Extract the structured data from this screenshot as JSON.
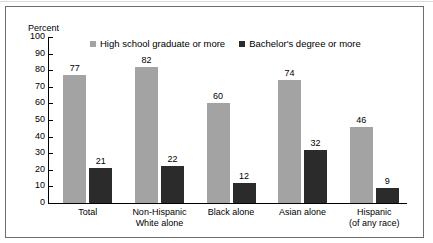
{
  "chart_data": {
    "type": "bar",
    "title": "",
    "xlabel": "",
    "ylabel": "Percent",
    "ylim": [
      0,
      100
    ],
    "yticks": [
      0,
      10,
      20,
      30,
      40,
      50,
      60,
      70,
      80,
      90,
      100
    ],
    "ytick_labels": [
      "0",
      "10",
      "20",
      "30",
      "40",
      "50",
      "60",
      "70",
      "80",
      "90",
      "100"
    ],
    "grid": false,
    "legend_position": "top-center",
    "categories": [
      "Total",
      "Non-Hispanic White alone",
      "Black alone",
      "Asian alone",
      "Hispanic (of any race)"
    ],
    "category_lines": [
      [
        "Total"
      ],
      [
        "Non-Hispanic",
        "White alone"
      ],
      [
        "Black alone"
      ],
      [
        "Asian alone"
      ],
      [
        "Hispanic",
        "(of any race)"
      ]
    ],
    "series": [
      {
        "name": "High school graduate or more",
        "color": "#a3a3a3",
        "values": [
          77,
          82,
          60,
          74,
          46
        ],
        "labels": [
          "77",
          "82",
          "60",
          "74",
          "46"
        ]
      },
      {
        "name": "Bachelor's degree or more",
        "color": "#2b2b2b",
        "values": [
          21,
          22,
          12,
          32,
          9
        ],
        "labels": [
          "21",
          "22",
          "12",
          "32",
          "9"
        ]
      }
    ]
  },
  "axis": {
    "y_title": "Percent"
  },
  "legend": {
    "items": [
      {
        "label": "High school graduate or more",
        "color": "#a3a3a3"
      },
      {
        "label": "Bachelor's degree or more",
        "color": "#2b2b2b"
      }
    ]
  }
}
